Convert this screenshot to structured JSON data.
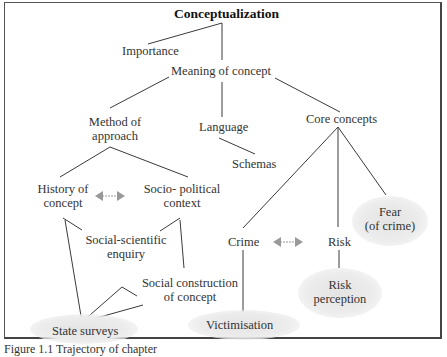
{
  "diagram": {
    "title": "Conceptualization",
    "nodes": {
      "importance": "Importance",
      "meaning": "Meaning of concept",
      "method_1": "Method of",
      "method_2": "approach",
      "language": "Language",
      "core": "Core concepts",
      "schemas": "Schemas",
      "history_1": "History of",
      "history_2": "concept",
      "socio_1": "Socio- political",
      "socio_2": "context",
      "ssi_1": "Social-scientific",
      "ssi_2": "enquiry",
      "scc_1": "Social construction",
      "scc_2": "of concept",
      "state": "State surveys",
      "crime": "Crime",
      "risk": "Risk",
      "fear_1": "Fear",
      "fear_2": "(of crime)",
      "riskp_1": "Risk",
      "riskp_2": "perception",
      "victim": "Victimisation"
    },
    "colors": {
      "line": "#3a3a3a",
      "arrow": "#999999",
      "highlight": "#e6e6e6"
    }
  },
  "caption": "Figure 1.1 Trajectory of chapter"
}
